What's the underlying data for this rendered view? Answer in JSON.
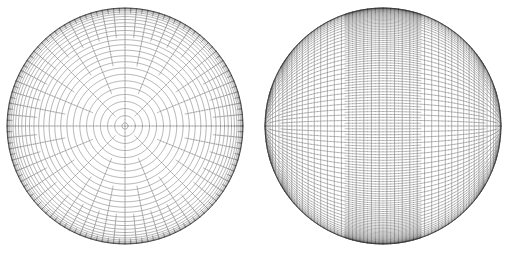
{
  "figure": {
    "width": 514,
    "height": 256,
    "background_color": "#ffffff",
    "panel_count": 2,
    "line_color": "#3a3a3a",
    "line_width": 0.45,
    "outline_color": "#2b2b2b",
    "outline_width": 0.7
  },
  "panels": [
    {
      "id": "left",
      "name": "pole-on-reduced-gaussian-grid",
      "label": "",
      "center_x": 125,
      "center_y": 126,
      "radius": 118,
      "view": {
        "type": "orthographic",
        "view_latitude_deg": 90,
        "view_longitude_deg": 0,
        "description": "viewed from directly above the grid pole"
      },
      "grid": {
        "type": "reduced_gaussian",
        "latitude_rings": 48,
        "meridian_count_at_equator": 192,
        "polar_cap_meridians": 4,
        "doubling_scheme": "longitude count doubles outward in octaves",
        "ring_latitudes_deg": [
          88.5,
          85.0,
          81.5,
          78.0,
          74.5,
          71.0,
          67.5,
          64.0,
          60.5,
          57.0,
          53.5,
          50.0,
          46.5,
          43.0,
          39.5,
          36.0,
          32.5,
          29.0,
          25.5,
          22.0,
          18.5,
          15.0,
          11.5,
          8.0,
          4.5,
          1.0,
          -2.5,
          -6.0,
          -9.5,
          -13.0,
          -16.5,
          -20.0,
          -23.5,
          -27.0,
          -30.5,
          -34.0,
          -37.5,
          -41.0,
          -44.5,
          -48.0,
          -51.5,
          -55.0,
          -58.5,
          -62.0,
          -65.5,
          -69.0,
          -72.5,
          -76.0
        ],
        "meridians_per_ring": [
          4,
          4,
          8,
          8,
          8,
          16,
          16,
          16,
          16,
          32,
          32,
          32,
          32,
          32,
          64,
          64,
          64,
          64,
          64,
          64,
          64,
          128,
          128,
          128,
          128,
          128,
          128,
          128,
          128,
          128,
          128,
          128,
          192,
          192,
          192,
          192,
          192,
          192,
          192,
          192,
          192,
          192,
          192,
          192,
          192,
          192,
          192,
          192
        ]
      }
    },
    {
      "id": "right",
      "name": "equator-on-rotated-grid",
      "label": "",
      "center_x": 383,
      "center_y": 126,
      "radius": 118,
      "view": {
        "type": "orthographic",
        "view_latitude_deg": 0,
        "view_longitude_deg": 45,
        "grid_pole_offset_deg": 90,
        "description": "same sphere rotated so the grid pole lies on the limb, producing two crossing curve families"
      },
      "grid": {
        "type": "reduced_gaussian_rotated",
        "latitude_rings": 48,
        "meridian_count_at_equator": 192,
        "polar_cap_meridians": 4,
        "doubling_scheme": "longitude count doubles outward in octaves",
        "rotation_axis": "y",
        "rotation_deg": 90
      }
    }
  ]
}
